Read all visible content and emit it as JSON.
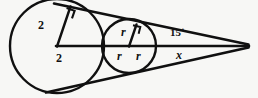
{
  "figure": {
    "background_color": "#f7f7f5",
    "stroke_color": "#101010",
    "labels": {
      "big_circle_radius_vertical": "2",
      "big_circle_radius_horizontal": "2",
      "small_circle_radius_vertical": "r",
      "small_circle_radius_left": "r",
      "small_circle_radius_right": "r",
      "apex_angle": "15˙",
      "apex_distance": "x"
    },
    "geometry": {
      "big_circle": {
        "cx": 57,
        "cy": 46,
        "r": 47
      },
      "small_circle": {
        "cx": 129,
        "cy": 46,
        "r": 27
      },
      "apex": {
        "x": 247,
        "y": 46
      },
      "axis_line": {
        "x1": 57,
        "y1": 46,
        "x2": 249,
        "y2": 46
      },
      "tangent_top": {
        "x1": 54,
        "y1": 4,
        "x2": 248,
        "y2": 44
      },
      "tangent_bottom": {
        "x1": 47,
        "y1": 92,
        "x2": 248,
        "y2": 48
      },
      "big_radius_vertical": {
        "x1": 57,
        "y1": 46,
        "x2": 71,
        "y2": 7
      },
      "small_radius_vertical": {
        "x1": 129,
        "y1": 46,
        "x2": 136,
        "y2": 25
      },
      "right_angle_marks": 2
    }
  }
}
